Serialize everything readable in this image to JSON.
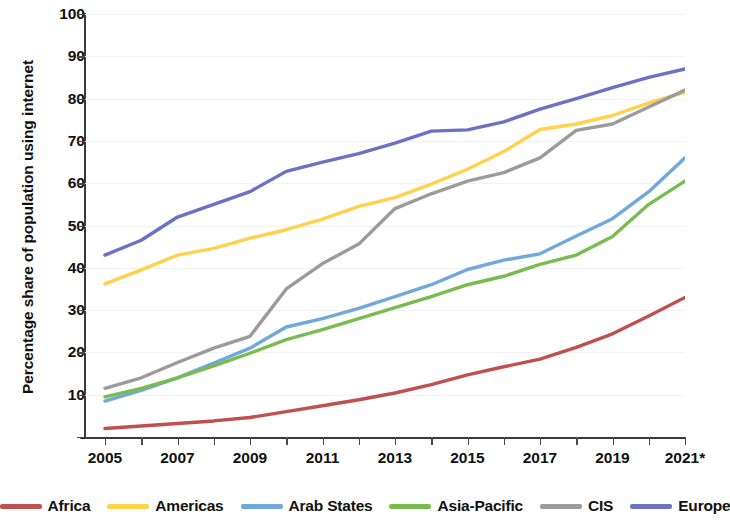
{
  "chart_data": {
    "type": "line",
    "title": "",
    "xlabel": "",
    "ylabel": "Percentage share of population using internet",
    "x": [
      "2005",
      "2006",
      "2007",
      "2008",
      "2009",
      "2010",
      "2011",
      "2012",
      "2013",
      "2014",
      "2015",
      "2016",
      "2017",
      "2018",
      "2019",
      "2020",
      "2021*"
    ],
    "xtick_labels": [
      "2005",
      "2007",
      "2009",
      "2011",
      "2013",
      "2015",
      "2017",
      "2019",
      "2021*"
    ],
    "ytick_labels": [
      "-",
      "10",
      "20",
      "30",
      "40",
      "50",
      "60",
      "70",
      "80",
      "90",
      "100"
    ],
    "ylim": [
      0,
      100
    ],
    "xlim": [
      "2005",
      "2021*"
    ],
    "grid": "faint-horizontal",
    "legend_position": "bottom",
    "note": "2021 value marked with asterisk (estimate)",
    "series": [
      {
        "name": "Africa",
        "color": "#C0504D",
        "values": [
          2.0,
          2.6,
          3.2,
          3.8,
          4.6,
          6.0,
          7.4,
          8.8,
          10.4,
          12.4,
          14.7,
          16.6,
          18.4,
          21.2,
          24.4,
          28.6,
          33.0
        ]
      },
      {
        "name": "Americas",
        "color": "#FFD24C",
        "values": [
          36.2,
          39.5,
          43.0,
          44.6,
          47.0,
          49.0,
          51.5,
          54.5,
          56.6,
          59.8,
          63.3,
          67.5,
          72.7,
          74.0,
          76.0,
          79.0,
          81.5
        ]
      },
      {
        "name": "Arab States",
        "color": "#70A8DC",
        "values": [
          8.5,
          11.0,
          14.0,
          17.5,
          21.0,
          26.0,
          28.0,
          30.4,
          33.2,
          36.0,
          39.6,
          41.8,
          43.3,
          47.5,
          51.6,
          58.0,
          66.0
        ]
      },
      {
        "name": "Asia-Pacific",
        "color": "#78BC4F",
        "values": [
          9.5,
          11.5,
          14.0,
          16.8,
          19.8,
          23.0,
          25.4,
          28.0,
          30.6,
          33.2,
          36.0,
          38.0,
          40.8,
          43.0,
          47.4,
          55.0,
          60.5
        ]
      },
      {
        "name": "CIS",
        "color": "#9B9B9B",
        "values": [
          11.5,
          14.0,
          17.6,
          21.0,
          23.8,
          35.0,
          41.0,
          45.6,
          54.0,
          57.5,
          60.5,
          62.5,
          66.0,
          72.5,
          74.0,
          78.0,
          82.0
        ]
      },
      {
        "name": "Europe",
        "color": "#6B72C4",
        "values": [
          43.0,
          46.5,
          52.0,
          55.0,
          58.0,
          62.8,
          65.0,
          67.0,
          69.5,
          72.3,
          72.6,
          74.5,
          77.5,
          80.0,
          82.6,
          85.0,
          87.0
        ]
      }
    ]
  },
  "axes": {
    "y_title": "Percentage share of population using internet",
    "y_ticks": [
      {
        "label": "100",
        "value": 100
      },
      {
        "label": "90",
        "value": 90
      },
      {
        "label": "80",
        "value": 80
      },
      {
        "label": "70",
        "value": 70
      },
      {
        "label": "60",
        "value": 60
      },
      {
        "label": "50",
        "value": 50
      },
      {
        "label": "40",
        "value": 40
      },
      {
        "label": "30",
        "value": 30
      },
      {
        "label": "20",
        "value": 20
      },
      {
        "label": "10",
        "value": 10
      },
      {
        "label": "-",
        "value": 0
      }
    ],
    "x_ticks": [
      {
        "label": "2005",
        "index": 0
      },
      {
        "label": "2007",
        "index": 2
      },
      {
        "label": "2009",
        "index": 4
      },
      {
        "label": "2011",
        "index": 6
      },
      {
        "label": "2013",
        "index": 8
      },
      {
        "label": "2015",
        "index": 10
      },
      {
        "label": "2017",
        "index": 12
      },
      {
        "label": "2019",
        "index": 14
      },
      {
        "label": "2021*",
        "index": 16
      }
    ]
  },
  "legend": {
    "items": [
      {
        "label": "Africa",
        "color": "#C0504D"
      },
      {
        "label": "Americas",
        "color": "#FFD24C"
      },
      {
        "label": "Arab States",
        "color": "#70A8DC"
      },
      {
        "label": "Asia-Pacific",
        "color": "#78BC4F"
      },
      {
        "label": "CIS",
        "color": "#9B9B9B"
      },
      {
        "label": "Europe",
        "color": "#6B72C4"
      }
    ]
  }
}
